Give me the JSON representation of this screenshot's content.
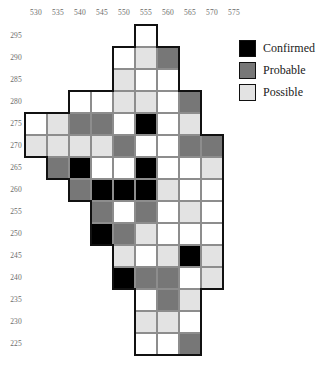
{
  "chart_data": {
    "type": "heatmap",
    "title": "",
    "xlabel": "",
    "ylabel": "",
    "grid": true,
    "legend_position": "top-right",
    "cell_size": 22,
    "origin": {
      "x": 25,
      "y": 25
    },
    "x_ticks": [
      530,
      535,
      540,
      545,
      550,
      555,
      560,
      565,
      570,
      575
    ],
    "y_ticks": [
      295,
      290,
      285,
      280,
      275,
      270,
      265,
      260,
      255,
      250,
      245,
      240,
      235,
      230,
      225
    ],
    "xlim": [
      527.5,
      577.5
    ],
    "ylim": [
      222.5,
      297.5
    ],
    "categories": [
      "Confirmed",
      "Probable",
      "Possible"
    ],
    "category_colors": {
      "Confirmed": "#000000",
      "Probable": "#777777",
      "Possible": "#e3e3e3",
      "None": "#ffffff"
    },
    "legend": [
      {
        "label": "Confirmed",
        "color": "#000000",
        "swatch": "sw-confirmed"
      },
      {
        "label": "Probable",
        "color": "#777777",
        "swatch": "sw-probable"
      },
      {
        "label": "Possible",
        "color": "#e3e3e3",
        "swatch": "sw-possible"
      }
    ],
    "columns": [
      530,
      535,
      540,
      545,
      550,
      555,
      560,
      565,
      570,
      575
    ],
    "rows": [
      {
        "y": 295,
        "start_col": 5,
        "cells": [
          "none"
        ]
      },
      {
        "y": 290,
        "start_col": 4,
        "cells": [
          "none",
          "possible",
          "probable"
        ]
      },
      {
        "y": 285,
        "start_col": 4,
        "cells": [
          "possible",
          "none",
          "none"
        ]
      },
      {
        "y": 280,
        "start_col": 2,
        "cells": [
          "none",
          "none",
          "possible",
          "possible",
          "none",
          "probable"
        ]
      },
      {
        "y": 275,
        "start_col": 0,
        "cells": [
          "none",
          "possible",
          "probable",
          "probable",
          "none",
          "confirmed",
          "none",
          "possible"
        ]
      },
      {
        "y": 270,
        "start_col": 0,
        "cells": [
          "possible",
          "possible",
          "possible",
          "possible",
          "probable",
          "none",
          "none",
          "probable",
          "probable"
        ]
      },
      {
        "y": 265,
        "start_col": 1,
        "cells": [
          "probable",
          "confirmed",
          "none",
          "none",
          "confirmed",
          "none",
          "none",
          "possible"
        ]
      },
      {
        "y": 260,
        "start_col": 2,
        "cells": [
          "probable",
          "confirmed",
          "confirmed",
          "confirmed",
          "possible",
          "none",
          "none"
        ]
      },
      {
        "y": 255,
        "start_col": 3,
        "cells": [
          "probable",
          "none",
          "probable",
          "none",
          "possible",
          "none"
        ]
      },
      {
        "y": 250,
        "start_col": 3,
        "cells": [
          "confirmed",
          "probable",
          "possible",
          "none",
          "none",
          "none"
        ]
      },
      {
        "y": 245,
        "start_col": 4,
        "cells": [
          "possible",
          "none",
          "possible",
          "confirmed",
          "possible"
        ]
      },
      {
        "y": 240,
        "start_col": 4,
        "cells": [
          "confirmed",
          "probable",
          "probable",
          "none",
          "possible"
        ]
      },
      {
        "y": 235,
        "start_col": 5,
        "cells": [
          "none",
          "probable",
          "possible"
        ]
      },
      {
        "y": 230,
        "start_col": 5,
        "cells": [
          "possible",
          "possible",
          "none"
        ]
      },
      {
        "y": 225,
        "start_col": 5,
        "cells": [
          "none",
          "none",
          "probable"
        ]
      }
    ]
  }
}
